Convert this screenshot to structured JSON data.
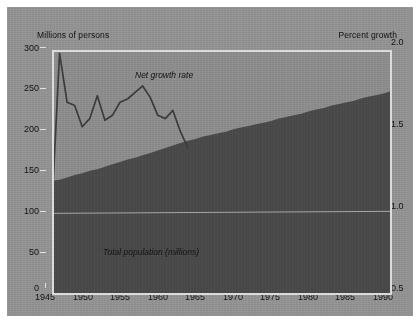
{
  "chart_data": {
    "type": "area",
    "title": "",
    "subtitle": "",
    "xlabel": "",
    "ylabel": "Millions of persons",
    "y2label": "Percent growth",
    "grid": false,
    "legend_position": "inline-annotations",
    "xlim": [
      1945,
      1990
    ],
    "ylim": [
      0,
      300
    ],
    "y2lim": [
      0.5,
      2.0
    ],
    "x_ticks": [
      1945,
      1950,
      1955,
      1960,
      1965,
      1970,
      1975,
      1980,
      1985,
      1990
    ],
    "y_ticks": [
      0,
      50,
      100,
      150,
      200,
      250,
      300
    ],
    "y2_ticks": [
      0.5,
      1.0,
      1.5,
      2.0
    ],
    "series": [
      {
        "name": "Total population (millions)",
        "type": "area",
        "axis": "left",
        "color": "#4a4a4a",
        "x": [
          1945,
          1946,
          1947,
          1948,
          1949,
          1950,
          1951,
          1952,
          1953,
          1954,
          1955,
          1956,
          1957,
          1958,
          1959,
          1960,
          1961,
          1962,
          1963,
          1964,
          1965,
          1966,
          1967,
          1968,
          1969,
          1970,
          1971,
          1972,
          1973,
          1974,
          1975,
          1976,
          1977,
          1978,
          1979,
          1980,
          1981,
          1982,
          1983,
          1984,
          1985,
          1986,
          1987,
          1988,
          1989,
          1990
        ],
        "values": [
          140,
          141,
          144,
          147,
          149,
          152,
          154,
          157,
          160,
          163,
          166,
          168,
          171,
          174,
          177,
          180,
          183,
          186,
          189,
          191,
          194,
          196,
          198,
          200,
          203,
          205,
          207,
          209,
          211,
          213,
          216,
          218,
          220,
          222,
          225,
          227,
          229,
          232,
          234,
          236,
          238,
          241,
          243,
          245,
          247,
          250
        ]
      },
      {
        "name": "Net growth rate",
        "type": "line",
        "axis": "right",
        "color": "#3d3d3d",
        "x": [
          1945,
          1946,
          1947,
          1948,
          1949,
          1950,
          1951,
          1952,
          1953,
          1954,
          1955,
          1956,
          1957,
          1958,
          1959,
          1960,
          1961,
          1962,
          1963
        ],
        "values": [
          1.05,
          1.98,
          1.68,
          1.66,
          1.53,
          1.58,
          1.72,
          1.57,
          1.6,
          1.68,
          1.7,
          1.74,
          1.78,
          1.71,
          1.6,
          1.58,
          1.63,
          1.5,
          1.4
        ]
      }
    ],
    "annotations": [
      {
        "text": "Net growth rate",
        "x": 1957,
        "y2": 1.8,
        "style": "italic"
      },
      {
        "text": "Total population (millions)",
        "x": 1961,
        "y": 52,
        "style": "italic"
      }
    ],
    "reference_line": {
      "name": "one-percent-reference",
      "axis": "right",
      "value": 1.0,
      "color": "#a8a8a8"
    }
  },
  "axes": {
    "left_title": "Millions of persons",
    "right_title": "Percent growth",
    "left_ticks": [
      "300",
      "250",
      "200",
      "150",
      "100",
      "50",
      "0"
    ],
    "right_ticks": [
      "2.0",
      "1.5",
      "1.0",
      "0.5"
    ],
    "x_ticks": [
      "1945",
      "1950",
      "1955",
      "1960",
      "1965",
      "1970",
      "1975",
      "1980",
      "1985",
      "1990"
    ]
  },
  "labels": {
    "growth_series": "Net growth rate",
    "population_series": "Total population (millions)"
  },
  "colors": {
    "plate_background": "#939393",
    "plot_background": "#8d8d8d",
    "area_fill": "#4a4a4a",
    "line": "#3d3d3d",
    "frame": "#dcdcdc",
    "text": "#131313"
  }
}
